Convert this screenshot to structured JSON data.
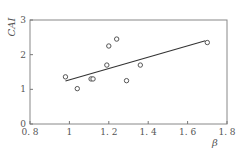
{
  "chart_data": {
    "type": "scatter",
    "title": "",
    "xlabel": "β",
    "ylabel": "CAI",
    "xlim": [
      0.8,
      1.8
    ],
    "ylim": [
      0,
      3
    ],
    "xticks": [
      0.8,
      1.0,
      1.2,
      1.4,
      1.6,
      1.8
    ],
    "xtick_labels": [
      "0. 8",
      "1",
      "1. 2",
      "1. 4",
      "1. 6",
      "1. 8"
    ],
    "yticks": [
      0,
      1,
      2,
      3
    ],
    "ytick_labels": [
      "0",
      "1",
      "2",
      "3"
    ],
    "grid": false,
    "legend": null,
    "series": [
      {
        "name": "observed",
        "marker": "open-circle",
        "points": [
          {
            "x": 0.98,
            "y": 1.36
          },
          {
            "x": 1.04,
            "y": 1.02
          },
          {
            "x": 1.11,
            "y": 1.3
          },
          {
            "x": 1.12,
            "y": 1.3
          },
          {
            "x": 1.19,
            "y": 1.7
          },
          {
            "x": 1.2,
            "y": 2.25
          },
          {
            "x": 1.24,
            "y": 2.45
          },
          {
            "x": 1.29,
            "y": 1.25
          },
          {
            "x": 1.36,
            "y": 1.7
          },
          {
            "x": 1.7,
            "y": 2.35
          }
        ]
      },
      {
        "name": "fit",
        "type": "line",
        "points": [
          {
            "x": 0.98,
            "y": 1.24
          },
          {
            "x": 1.69,
            "y": 2.4
          }
        ]
      }
    ]
  },
  "colors": {
    "axis": "#777777",
    "marker": "#555555",
    "line": "#333333"
  }
}
